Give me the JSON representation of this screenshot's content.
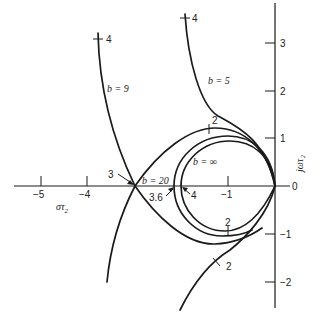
{
  "diagram": {
    "type": "root-locus",
    "real_axis": {
      "label": "στ₂",
      "label_main": "στ",
      "label_sub": "2",
      "ticks": [
        {
          "value": -5,
          "label": "−5"
        },
        {
          "value": -4,
          "label": "−4"
        },
        {
          "value": -1,
          "label": "−1"
        }
      ]
    },
    "imag_axis": {
      "label": "jωτ₂",
      "ticks": [
        {
          "value": 3,
          "label": "3"
        },
        {
          "value": 2,
          "label": "2"
        },
        {
          "value": 1,
          "label": "1"
        },
        {
          "value": 0,
          "label": "0"
        },
        {
          "value": -1,
          "label": "−1"
        },
        {
          "value": -2,
          "label": "−2"
        }
      ]
    },
    "curves": [
      {
        "name": "b-9",
        "label": "b = 9"
      },
      {
        "name": "b-5",
        "label": "b = 5"
      },
      {
        "name": "b-20",
        "label": "b = 20"
      },
      {
        "name": "b-infinity",
        "label": "b = ∞"
      }
    ],
    "annotations": {
      "b9_top_gain": "4",
      "b5_top_gain": "4",
      "b20_top_gain": "2",
      "b20_bottom_gain": "2",
      "b5_bottom_gain": "2",
      "breakaway_gain": "3",
      "b20_real_crossing": "3.6",
      "binf_real_crossing": "4"
    }
  }
}
